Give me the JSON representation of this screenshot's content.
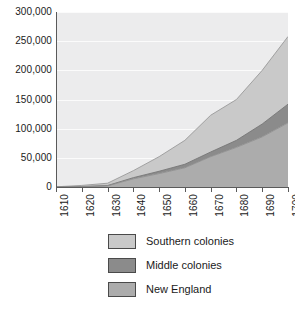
{
  "chart_data": {
    "type": "area",
    "stacked": true,
    "title": "",
    "subtitle": "",
    "xlabel": "",
    "ylabel": "",
    "x": [
      1610,
      1620,
      1630,
      1640,
      1650,
      1660,
      1670,
      1680,
      1690,
      1700
    ],
    "categories": [
      "1610",
      "1620",
      "1630",
      "1640",
      "1650",
      "1660",
      "1670",
      "1680",
      "1690",
      "1700"
    ],
    "xlim": [
      1610,
      1700
    ],
    "ylim": [
      0,
      300000
    ],
    "ytick_values": [
      0,
      50000,
      100000,
      150000,
      200000,
      250000,
      300000
    ],
    "ytick_labels": [
      "0",
      "50,000",
      "100,000",
      "150,000",
      "200,000",
      "250,000",
      "300,000"
    ],
    "grid": true,
    "grid_axis": "y",
    "legend_position": "bottom",
    "series": [
      {
        "name": "New England",
        "color": "#acacac",
        "values": [
          0,
          500,
          2000,
          14000,
          23000,
          33000,
          52000,
          68000,
          86000,
          110000
        ]
      },
      {
        "name": "Middle colonies",
        "color": "#8b8b8b",
        "values": [
          0,
          200,
          500,
          2000,
          4000,
          6000,
          8000,
          12000,
          22000,
          32000
        ]
      },
      {
        "name": "Southern colonies",
        "color": "#c9c9c9",
        "values": [
          350,
          2000,
          4000,
          12000,
          25000,
          41000,
          63000,
          70000,
          92000,
          116000
        ]
      }
    ],
    "stack_tops": {
      "new_england": [
        0,
        500,
        2000,
        14000,
        23000,
        33000,
        52000,
        68000,
        86000,
        110000
      ],
      "plus_middle": [
        0,
        700,
        2500,
        16000,
        27000,
        39000,
        60000,
        80000,
        108000,
        142000
      ],
      "plus_southern": [
        350,
        2700,
        6500,
        28000,
        52000,
        80000,
        123000,
        150000,
        200000,
        258000
      ]
    }
  },
  "legend": {
    "items": [
      {
        "label": "Southern colonies",
        "color": "#c9c9c9"
      },
      {
        "label": "Middle colonies",
        "color": "#8b8b8b"
      },
      {
        "label": "New England",
        "color": "#acacac"
      }
    ]
  },
  "axes": {
    "y_labels": [
      "300,000",
      "250,000",
      "200,000",
      "150,000",
      "100,000",
      "50,000",
      "0"
    ],
    "x_labels": [
      "1610",
      "1620",
      "1630",
      "1640",
      "1650",
      "1660",
      "1670",
      "1680",
      "1690",
      "1700"
    ]
  },
  "colors": {
    "plot_background": "#ececed",
    "gridline": "#fbfbfb",
    "axis": "#5a5a5a",
    "text": "#1a1a1a",
    "southern": "#c9c9c9",
    "middle": "#8b8b8b",
    "new_england": "#acacac"
  }
}
